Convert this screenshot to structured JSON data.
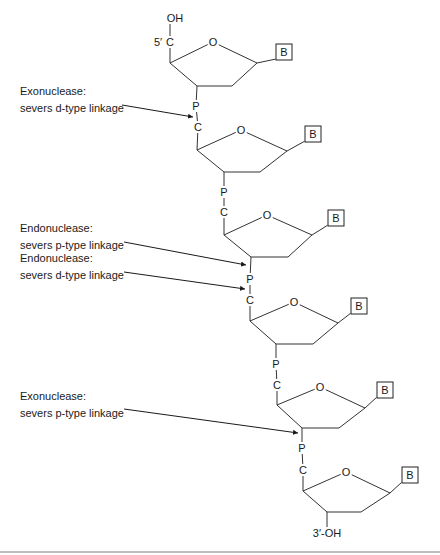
{
  "diagram": {
    "type": "DNA strand with nuclease cleavage sites",
    "top_terminal": {
      "label": "OH",
      "prime_label": "5′"
    },
    "bottom_terminal": {
      "label": "3′-OH"
    },
    "atom_labels": {
      "carbon": "C",
      "oxygen": "O",
      "phosphorus": "P",
      "base": "B"
    },
    "units": [
      {
        "c": [
          170,
          42
        ],
        "c4": [
          170,
          63
        ],
        "o": [
          213,
          42
        ],
        "c1": [
          257,
          63
        ],
        "b": [
          284,
          52
        ],
        "c2": [
          232,
          86
        ],
        "c3": [
          197,
          86
        ],
        "p": [
          196,
          106
        ]
      },
      {
        "c": [
          198,
          127
        ],
        "c4": [
          197,
          150
        ],
        "o": [
          241,
          130
        ],
        "c1": [
          287,
          151
        ],
        "b": [
          313,
          134
        ],
        "c2": [
          260,
          172
        ],
        "c3": [
          224,
          172
        ],
        "p": [
          224,
          192
        ]
      },
      {
        "c": [
          224,
          212
        ],
        "c4": [
          224,
          235
        ],
        "o": [
          267,
          215
        ],
        "c1": [
          312,
          235
        ],
        "b": [
          336,
          218
        ],
        "c2": [
          288,
          257
        ],
        "c3": [
          251,
          257
        ],
        "p": [
          250,
          279
        ]
      },
      {
        "c": [
          250,
          300
        ],
        "c4": [
          250,
          321
        ],
        "o": [
          294,
          302
        ],
        "c1": [
          338,
          323
        ],
        "b": [
          359,
          306
        ],
        "c2": [
          313,
          344
        ],
        "c3": [
          276,
          344
        ],
        "p": [
          276,
          364
        ]
      },
      {
        "c": [
          277,
          385
        ],
        "c4": [
          277,
          405
        ],
        "o": [
          320,
          387
        ],
        "c1": [
          365,
          408
        ],
        "b": [
          385,
          390
        ],
        "c2": [
          339,
          428
        ],
        "c3": [
          302,
          428
        ],
        "p": [
          302,
          448
        ]
      },
      {
        "c": [
          303,
          470
        ],
        "c4": [
          303,
          491
        ],
        "o": [
          346,
          472
        ],
        "c1": [
          390,
          493
        ],
        "b": [
          410,
          475
        ],
        "c2": [
          361,
          512
        ],
        "c3": [
          327,
          512
        ],
        "p": null
      }
    ],
    "annotations": [
      {
        "line1": "Exonuclease:",
        "line2": "severs d-type linkage",
        "x": 20,
        "y": 85,
        "arrow_from": [
          122,
          105
        ],
        "arrow_to": [
          193,
          117
        ]
      },
      {
        "line1": "Endonuclease:",
        "line2": "severs p-type linkage",
        "x": 20,
        "y": 222,
        "arrow_from": [
          124,
          242
        ],
        "arrow_to": [
          246,
          265
        ]
      },
      {
        "line1": "Endonuclease:",
        "line2": "severs d-type linkage",
        "x": 20,
        "y": 252,
        "arrow_from": [
          124,
          272
        ],
        "arrow_to": [
          245,
          289
        ]
      },
      {
        "line1": "Exonuclease:",
        "line2": "severs p-type linkage",
        "x": 20,
        "y": 390,
        "arrow_from": [
          124,
          409
        ],
        "arrow_to": [
          298,
          433
        ]
      }
    ]
  }
}
